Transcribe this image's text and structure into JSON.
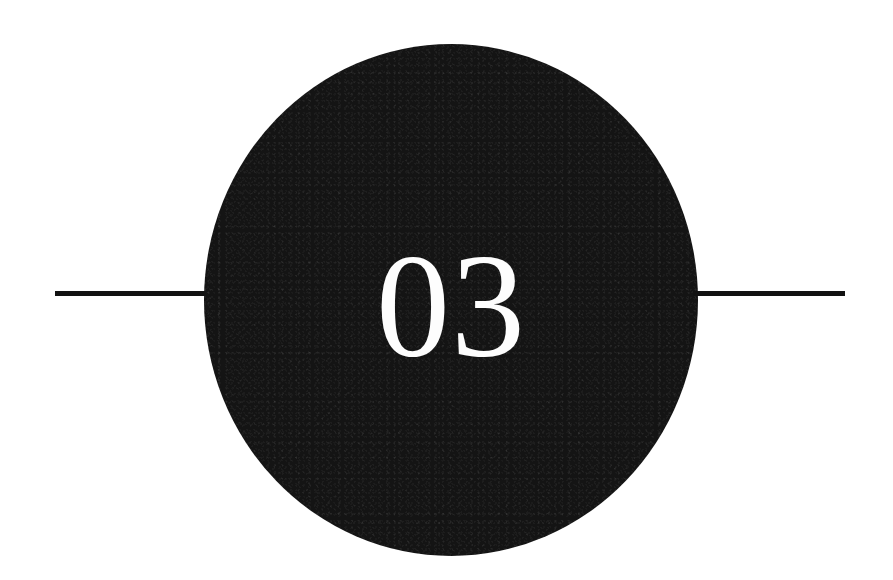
{
  "page": {
    "background_color": "#ffffff",
    "width": 893,
    "height": 580
  },
  "divider": {
    "name": "chapter-divider",
    "disc": {
      "label": "03",
      "fill_color": "#141414",
      "text_color": "#fdfdfd",
      "center_x": 451,
      "center_y": 300,
      "width": 494,
      "height": 512
    },
    "rules": {
      "color": "#121212",
      "thickness": 5,
      "y": 291,
      "left": {
        "start_x": 55,
        "end_x": 213
      },
      "right": {
        "start_x": 693,
        "end_x": 845
      }
    }
  }
}
